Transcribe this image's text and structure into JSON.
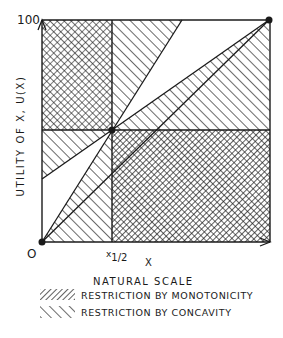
{
  "diagram": {
    "y_axis_label": "UTILITY OF X, U(X)",
    "y_axis_max_label": "100",
    "origin_label": "O",
    "x_midpoint_label": "x",
    "x_midpoint_sub": "1/2",
    "x_axis_var": "X",
    "x_axis_label": "NATURAL SCALE",
    "colors": {
      "ink": "#1a1a1a",
      "background": "#ffffff"
    }
  },
  "legend": {
    "items": [
      {
        "label": "RESTRICTION BY MONOTONICITY",
        "pattern": "dense-forward-hatch"
      },
      {
        "label": "RESTRICTION BY CONCAVITY",
        "pattern": "sparse-backward-hatch"
      }
    ]
  },
  "geometry": {
    "origin": [
      0,
      0
    ],
    "top_right": [
      100,
      100
    ],
    "midpoint": [
      "x1/2",
      50
    ],
    "regions": [
      {
        "name": "upper-left quadrant",
        "restriction": [
          "monotonicity",
          "concavity"
        ]
      },
      {
        "name": "lower-right quadrant",
        "restriction": [
          "monotonicity",
          "concavity"
        ]
      },
      {
        "name": "upper-right wedge near vertical",
        "restriction": [
          "concavity"
        ]
      },
      {
        "name": "upper-right wedge below chord",
        "restriction": [
          "concavity"
        ]
      },
      {
        "name": "lower-left wedge near horizontal",
        "restriction": [
          "concavity"
        ]
      },
      {
        "name": "lower-left wedge below diagonal",
        "restriction": [
          "concavity"
        ]
      }
    ]
  }
}
